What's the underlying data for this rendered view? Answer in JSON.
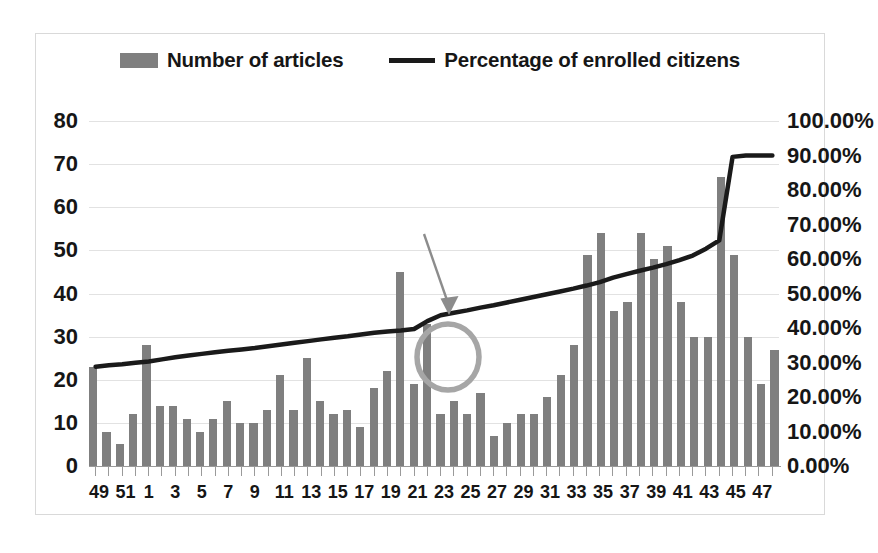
{
  "chart_data": {
    "type": "bar",
    "title": "",
    "subtitle": "",
    "xlabel": "",
    "ylabel": "",
    "y2label": "",
    "grid": true,
    "legend_position": "top-center",
    "ylim": [
      0,
      80
    ],
    "y2lim": [
      0,
      1.0
    ],
    "y_ticks": [
      "0",
      "10",
      "20",
      "30",
      "40",
      "50",
      "60",
      "70",
      "80"
    ],
    "y2_ticks": [
      "0.00%",
      "10.00%",
      "20.00%",
      "30.00%",
      "40.00%",
      "50.00%",
      "60.00%",
      "70.00%",
      "80.00%",
      "90.00%",
      "100.00%"
    ],
    "categories": [
      "49",
      "50",
      "51",
      "52",
      "1",
      "2",
      "3",
      "4",
      "5",
      "6",
      "7",
      "8",
      "9",
      "10",
      "11",
      "12",
      "13",
      "14",
      "15",
      "16",
      "17",
      "18",
      "19",
      "20",
      "21",
      "22",
      "23",
      "24",
      "25",
      "26",
      "27",
      "28",
      "29",
      "30",
      "31",
      "32",
      "33",
      "34",
      "35",
      "36",
      "37",
      "38",
      "39",
      "40",
      "41",
      "42",
      "43",
      "44",
      "45",
      "46",
      "47",
      "48"
    ],
    "x_tick_labels": [
      "49",
      "",
      "51",
      "",
      "1",
      "",
      "3",
      "",
      "5",
      "",
      "7",
      "",
      "9",
      "",
      "11",
      "",
      "13",
      "",
      "15",
      "",
      "17",
      "",
      "19",
      "",
      "21",
      "",
      "23",
      "",
      "25",
      "",
      "27",
      "",
      "29",
      "",
      "31",
      "",
      "33",
      "",
      "35",
      "",
      "37",
      "",
      "39",
      "",
      "41",
      "",
      "43",
      "",
      "45",
      "",
      "47",
      ""
    ],
    "series": [
      {
        "name": "Number of articles",
        "type": "bar",
        "axis": "left",
        "color": "#7f7f7f",
        "values": [
          23,
          8,
          5,
          12,
          28,
          14,
          14,
          11,
          8,
          11,
          15,
          10,
          10,
          13,
          21,
          13,
          25,
          15,
          12,
          13,
          9,
          18,
          22,
          45,
          19,
          33,
          12,
          15,
          12,
          17,
          7,
          10,
          12,
          12,
          16,
          21,
          28,
          49,
          54,
          36,
          38,
          54,
          48,
          51,
          38,
          30,
          30,
          67,
          49,
          30,
          19,
          27
        ]
      },
      {
        "name": "Percentage of enrolled citizens",
        "type": "line",
        "axis": "right",
        "color": "#1a1a1a",
        "values": [
          0.288,
          0.292,
          0.295,
          0.299,
          0.303,
          0.309,
          0.315,
          0.32,
          0.325,
          0.33,
          0.334,
          0.338,
          0.342,
          0.347,
          0.352,
          0.357,
          0.362,
          0.367,
          0.372,
          0.376,
          0.381,
          0.386,
          0.39,
          0.393,
          0.397,
          0.42,
          0.437,
          0.444,
          0.451,
          0.459,
          0.466,
          0.474,
          0.482,
          0.49,
          0.498,
          0.506,
          0.514,
          0.523,
          0.533,
          0.546,
          0.556,
          0.566,
          0.575,
          0.585,
          0.597,
          0.61,
          0.63,
          0.654,
          0.896,
          0.9,
          0.9,
          0.9
        ]
      }
    ],
    "annotations": [
      {
        "kind": "ellipse-highlight",
        "label": "circle-highlight",
        "color": "#a6a6a6",
        "target_category": "22",
        "note": "gray circle around the line kink"
      },
      {
        "kind": "arrow",
        "label": "callout-arrow",
        "color": "#808080",
        "note": "arrow pointing down-right to the circled kink"
      }
    ]
  },
  "legend": {
    "entries": [
      {
        "label": "Number of articles",
        "swatch": "bar-swatch",
        "color": "#7f7f7f"
      },
      {
        "label": "Percentage of enrolled citizens",
        "swatch": "line-swatch",
        "color": "#1a1a1a"
      }
    ]
  },
  "colors": {
    "bar": "#7f7f7f",
    "line": "#1a1a1a",
    "grid": "#e2e2e2",
    "frame": "#d9d9d9",
    "annotation": "#a6a6a6",
    "text": "#161616",
    "background": "#ffffff"
  }
}
